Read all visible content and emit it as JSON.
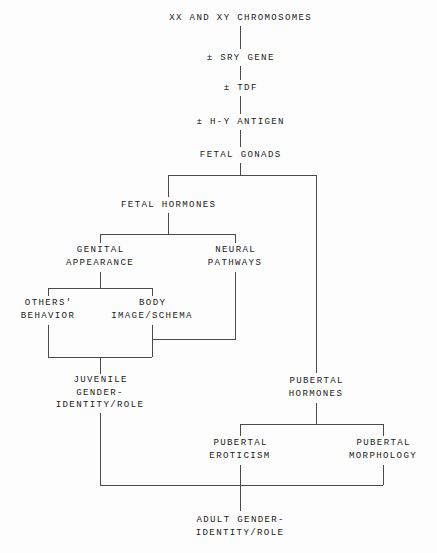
{
  "diagram": {
    "type": "flowchart",
    "orientation": "top-down",
    "colors": {
      "background": "#fdfdfd",
      "line": "#4a4a4a",
      "text": "#1b1b1b"
    },
    "nodes": [
      {
        "id": "chromosomes",
        "label": "XX AND XY CHROMOSOMES",
        "x": 240,
        "y": 18
      },
      {
        "id": "sry",
        "label": "± SRY GENE",
        "x": 240,
        "y": 58
      },
      {
        "id": "tdf",
        "label": "± TDF",
        "x": 240,
        "y": 88
      },
      {
        "id": "hy",
        "label": "± H-Y ANTIGEN",
        "x": 240,
        "y": 122
      },
      {
        "id": "fetal_gonads",
        "label": "FETAL GONADS",
        "x": 240,
        "y": 155
      },
      {
        "id": "fetal_hormones",
        "label": "FETAL HORMONES",
        "x": 168,
        "y": 205
      },
      {
        "id": "genital",
        "label": "GENITAL\nAPPEARANCE",
        "x": 100,
        "y": 257
      },
      {
        "id": "neural",
        "label": "NEURAL\nPATHWAYS",
        "x": 235,
        "y": 257
      },
      {
        "id": "others",
        "label": "OTHERS'\nBEHAVIOR",
        "x": 48,
        "y": 310
      },
      {
        "id": "body_image",
        "label": "BODY\nIMAGE/SCHEMA",
        "x": 152,
        "y": 310
      },
      {
        "id": "juvenile",
        "label": "JUVENILE\nGENDER-\nIDENTITY/ROLE",
        "x": 100,
        "y": 393
      },
      {
        "id": "pub_hormones",
        "label": "PUBERTAL\nHORMONES",
        "x": 316,
        "y": 388
      },
      {
        "id": "pub_eroticism",
        "label": "PUBERTAL\nEROTICISM",
        "x": 240,
        "y": 450
      },
      {
        "id": "pub_morphology",
        "label": "PUBERTAL\nMORPHOLOGY",
        "x": 383,
        "y": 450
      },
      {
        "id": "adult",
        "label": "ADULT GENDER-\nIDENTITY/ROLE",
        "x": 240,
        "y": 527
      }
    ],
    "edges": [
      {
        "from": "chromosomes",
        "to": "sry"
      },
      {
        "from": "sry",
        "to": "tdf"
      },
      {
        "from": "tdf",
        "to": "hy"
      },
      {
        "from": "hy",
        "to": "fetal_gonads"
      },
      {
        "from": "fetal_gonads",
        "to": "fetal_hormones"
      },
      {
        "from": "fetal_gonads",
        "to": "pub_hormones"
      },
      {
        "from": "fetal_hormones",
        "to": "genital"
      },
      {
        "from": "fetal_hormones",
        "to": "neural"
      },
      {
        "from": "genital",
        "to": "others"
      },
      {
        "from": "genital",
        "to": "body_image"
      },
      {
        "from": "neural",
        "to": "body_image"
      },
      {
        "from": "others",
        "to": "juvenile"
      },
      {
        "from": "body_image",
        "to": "juvenile"
      },
      {
        "from": "pub_hormones",
        "to": "pub_eroticism"
      },
      {
        "from": "pub_hormones",
        "to": "pub_morphology"
      },
      {
        "from": "juvenile",
        "to": "adult"
      },
      {
        "from": "pub_eroticism",
        "to": "adult"
      },
      {
        "from": "pub_morphology",
        "to": "adult"
      }
    ]
  }
}
